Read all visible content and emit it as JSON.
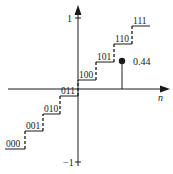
{
  "diagram": {
    "type": "quantizer-staircase",
    "axes": {
      "x_label": "n",
      "y_top_label": "1",
      "y_bottom_label": "−1"
    },
    "levels": [
      {
        "code": "000",
        "x1": 5,
        "x2": 25,
        "y": 149
      },
      {
        "code": "001",
        "x1": 25,
        "x2": 43,
        "y": 131
      },
      {
        "code": "010",
        "x1": 43,
        "x2": 60,
        "y": 114
      },
      {
        "code": "011",
        "x1": 60,
        "x2": 78,
        "y": 96
      },
      {
        "code": "100",
        "x1": 78,
        "x2": 96,
        "y": 80
      },
      {
        "code": "101",
        "x1": 96,
        "x2": 114,
        "y": 62
      },
      {
        "code": "110",
        "x1": 114,
        "x2": 132,
        "y": 44
      },
      {
        "code": "111",
        "x1": 132,
        "x2": 150,
        "y": 26
      }
    ],
    "sample": {
      "value_label": "0.44",
      "x": 122,
      "y": 61
    },
    "colors": {
      "ink": "#1a1a1a",
      "background": "#ffffff"
    }
  }
}
